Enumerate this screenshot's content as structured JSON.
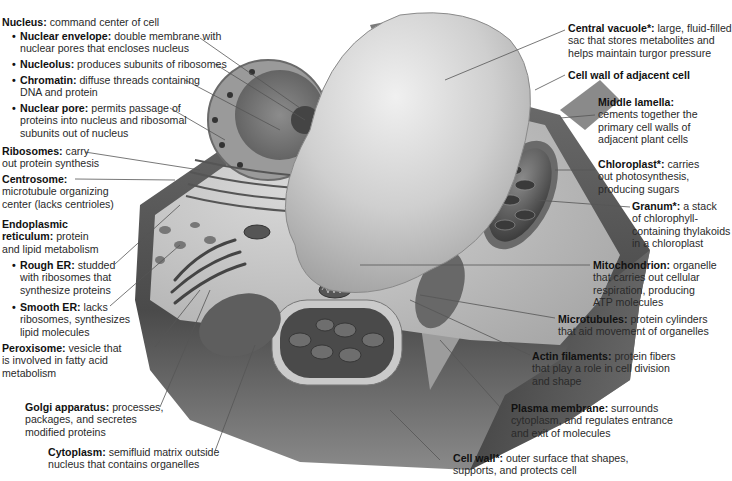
{
  "colors": {
    "background": "#ffffff",
    "text": "#2a2a2a",
    "term_text": "#111111",
    "leader_line": "#555555",
    "cell_wall_dark": "#5a5a5a",
    "vacuole": "#c8c8c8"
  },
  "labels": {
    "nucleus": {
      "term": "Nucleus:",
      "desc": [
        "command center of cell"
      ]
    },
    "nuclear_envelope": {
      "term": "Nuclear envelope:",
      "desc": [
        "double membrane with",
        "nuclear pores that encloses nucleus"
      ]
    },
    "nucleolus": {
      "term": "Nucleolus:",
      "desc": [
        "produces subunits of ribosomes"
      ]
    },
    "chromatin": {
      "term": "Chromatin:",
      "desc": [
        "diffuse threads containing",
        "DNA and protein"
      ]
    },
    "nuclear_pore": {
      "term": "Nuclear pore:",
      "desc": [
        "permits passage of",
        "proteins into nucleus and ribosomal",
        "subunits out of nucleus"
      ]
    },
    "ribosomes": {
      "term": "Ribosomes:",
      "desc": [
        "carry",
        "out protein synthesis"
      ]
    },
    "centrosome": {
      "term": "Centrosome:",
      "desc": [
        "",
        "microtubule organizing",
        "center (lacks centrioles)"
      ]
    },
    "er": {
      "term": "Endoplasmic",
      "term2": "reticulum:",
      "desc": [
        "protein",
        "and lipid metabolism"
      ]
    },
    "rough_er": {
      "term": "Rough ER:",
      "desc": [
        "studded",
        "with ribosomes that",
        "synthesize proteins"
      ]
    },
    "smooth_er": {
      "term": "Smooth ER:",
      "desc": [
        "lacks",
        "ribosomes, synthesizes",
        "lipid molecules"
      ]
    },
    "peroxisome": {
      "term": "Peroxisome:",
      "desc": [
        "vesicle that",
        "is involved in fatty acid",
        "metabolism"
      ]
    },
    "golgi": {
      "term": "Golgi apparatus:",
      "desc": [
        "processes,",
        "packages, and secretes",
        "modified proteins"
      ]
    },
    "cytoplasm": {
      "term": "Cytoplasm:",
      "desc": [
        "semifluid matrix outside",
        "nucleus that contains organelles"
      ]
    },
    "central_vacuole": {
      "term": "Central vacuole*:",
      "desc": [
        "large, fluid-filled",
        "sac that stores metabolites and",
        "helps maintain turgor pressure"
      ]
    },
    "adjacent_wall": {
      "term": "Cell wall of adjacent cell",
      "desc": []
    },
    "middle_lamella": {
      "term": "Middle lamella:",
      "desc": [
        "cements together the",
        "primary cell walls of",
        "adjacent plant cells"
      ]
    },
    "chloroplast": {
      "term": "Chloroplast*:",
      "desc": [
        "carries",
        "out photosynthesis,",
        "producing sugars"
      ]
    },
    "granum": {
      "term": "Granum*:",
      "desc": [
        "a stack",
        "of chlorophyll-",
        "containing thylakoids",
        "in a chloroplast"
      ]
    },
    "mitochondrion": {
      "term": "Mitochondrion:",
      "desc": [
        "organelle",
        "that carries out cellular",
        "respiration, producing",
        "ATP molecules"
      ]
    },
    "microtubules": {
      "term": "Microtubules:",
      "desc": [
        "protein cylinders",
        "that aid movement of organelles"
      ]
    },
    "actin": {
      "term": "Actin filaments:",
      "desc": [
        "protein fibers",
        "that play a role in cell division",
        "and shape"
      ]
    },
    "plasma_membrane": {
      "term": "Plasma membrane:",
      "desc": [
        "surrounds",
        "cytoplasm, and regulates entrance",
        "and exit of molecules"
      ]
    },
    "cell_wall": {
      "term": "Cell wall*:",
      "desc": [
        "outer surface that shapes,",
        "supports, and protects cell"
      ]
    }
  }
}
